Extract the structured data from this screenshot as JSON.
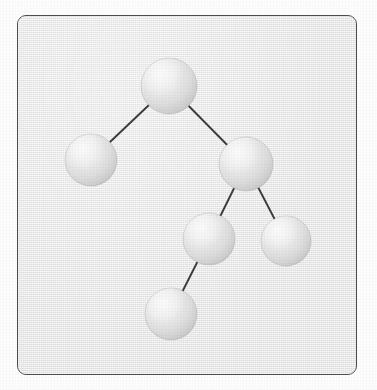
{
  "figure": {
    "kind": "binary-tree-diagram",
    "title": "",
    "frame": {
      "x": 17,
      "y": 15,
      "width": 340,
      "height": 360,
      "border_color": "#4c4c4c",
      "border_radius": 9,
      "background_color": "#ebebeb"
    },
    "page_background_color": "#fdfdfd",
    "edge_color": "#3a3a3a",
    "edge_width": 1.9,
    "sphere_light_color": "#f4f4f4",
    "sphere_mid_color": "#d9d9d9",
    "sphere_shadow_color": "#b9b9b9"
  },
  "graph": {
    "node_count": 6,
    "edge_count": 5,
    "nodes": [
      {
        "id": "root",
        "label": "",
        "cx": 151,
        "cy": 70,
        "r": 28
      },
      {
        "id": "left-child",
        "label": "",
        "cx": 73,
        "cy": 144,
        "r": 26
      },
      {
        "id": "right-child",
        "label": "",
        "cx": 228,
        "cy": 148,
        "r": 27
      },
      {
        "id": "inner-left",
        "label": "",
        "cx": 191,
        "cy": 223,
        "r": 26
      },
      {
        "id": "inner-right",
        "label": "",
        "cx": 268,
        "cy": 225,
        "r": 25
      },
      {
        "id": "leaf-bottom",
        "label": "",
        "cx": 153,
        "cy": 298,
        "r": 26
      }
    ],
    "edges": [
      {
        "id": "edge-root-left",
        "from": "root",
        "to": "left-child"
      },
      {
        "id": "edge-root-right",
        "from": "root",
        "to": "right-child"
      },
      {
        "id": "edge-right-innerleft",
        "from": "right-child",
        "to": "inner-left"
      },
      {
        "id": "edge-right-innerright",
        "from": "right-child",
        "to": "inner-right"
      },
      {
        "id": "edge-innerleft-leaf",
        "from": "inner-left",
        "to": "leaf-bottom"
      }
    ]
  }
}
